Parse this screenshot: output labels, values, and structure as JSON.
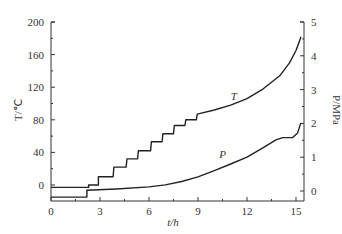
{
  "chart_data": {
    "type": "line",
    "title": "",
    "xlabel": "t/h",
    "ylabel_left": "T/℃",
    "ylabel_right": "P/MPa",
    "xlim": [
      0,
      15.5
    ],
    "ylim_left": [
      -20,
      200
    ],
    "ylim_right": [
      -0.2,
      5
    ],
    "x_ticks": [
      0,
      3,
      6,
      9,
      12,
      15
    ],
    "y_ticks_left": [
      0,
      40,
      80,
      120,
      160,
      200
    ],
    "y_ticks_right": [
      0,
      1,
      2,
      3,
      4,
      5
    ],
    "grid": false,
    "legend": "inline labels",
    "series": [
      {
        "name": "T",
        "axis": "left",
        "label_text": "T",
        "points": [
          [
            0,
            -3
          ],
          [
            2.3,
            -3
          ],
          [
            2.3,
            0
          ],
          [
            2.9,
            0
          ],
          [
            2.9,
            10
          ],
          [
            3.8,
            10
          ],
          [
            3.85,
            22
          ],
          [
            4.6,
            22
          ],
          [
            4.65,
            32
          ],
          [
            5.3,
            32
          ],
          [
            5.35,
            42
          ],
          [
            6.1,
            42
          ],
          [
            6.15,
            53
          ],
          [
            6.8,
            53
          ],
          [
            6.85,
            63
          ],
          [
            7.5,
            63
          ],
          [
            7.55,
            73
          ],
          [
            8.2,
            73
          ],
          [
            8.25,
            80
          ],
          [
            8.9,
            80
          ],
          [
            8.95,
            87
          ],
          [
            10,
            92
          ],
          [
            11,
            98
          ],
          [
            12,
            106
          ],
          [
            13,
            118
          ],
          [
            14,
            134
          ],
          [
            14.6,
            150
          ],
          [
            15,
            165
          ],
          [
            15.2,
            176
          ],
          [
            15.3,
            182
          ]
        ]
      },
      {
        "name": "P",
        "axis": "right",
        "label_text": "P",
        "points": [
          [
            0,
            -0.18
          ],
          [
            2.2,
            -0.18
          ],
          [
            2.2,
            0.02
          ],
          [
            4,
            0.06
          ],
          [
            6,
            0.12
          ],
          [
            7,
            0.18
          ],
          [
            8,
            0.28
          ],
          [
            9,
            0.42
          ],
          [
            10,
            0.6
          ],
          [
            11,
            0.8
          ],
          [
            12,
            1.0
          ],
          [
            13,
            1.28
          ],
          [
            13.8,
            1.52
          ],
          [
            14.2,
            1.58
          ],
          [
            14.8,
            1.58
          ],
          [
            15.1,
            1.72
          ],
          [
            15.25,
            1.95
          ],
          [
            15.3,
            2.0
          ]
        ]
      }
    ],
    "annotations": [
      {
        "text": "T",
        "x": 11.2,
        "y_left": 99
      },
      {
        "text": "P",
        "x": 10.5,
        "y_right": 0.85
      }
    ]
  },
  "axes": {
    "x_title": "t/h",
    "left_title": "T/℃",
    "right_title": "P/MPa"
  }
}
